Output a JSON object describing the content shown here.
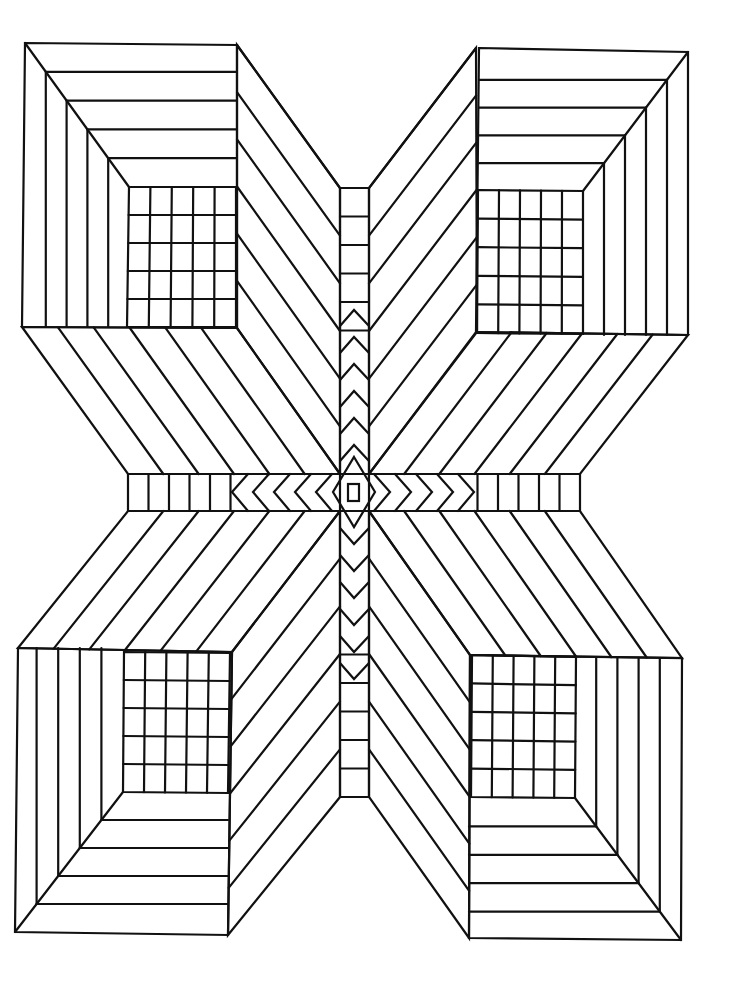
{
  "artwork": {
    "subject": "Geometric optical-illusion line drawing: four open boxes joined by a central cross",
    "stroke_color": "#111111",
    "background_color": "#ffffff",
    "canvas": {
      "width": 731,
      "height": 982
    }
  },
  "center": {
    "x": 354,
    "y": 492
  },
  "vertical_bar": {
    "x1": 340,
    "x2": 369,
    "top": 188,
    "bottom": 797
  },
  "horizontal_bar": {
    "y1": 474,
    "y2": 511,
    "left": 128,
    "right": 580
  },
  "boxes": [
    {
      "name": "top-left",
      "outer": [
        [
          25,
          43
        ],
        [
          237,
          45
        ],
        [
          237,
          328
        ],
        [
          22,
          327
        ]
      ],
      "grid": [
        [
          129,
          187
        ],
        [
          236,
          187
        ],
        [
          236,
          327
        ],
        [
          127,
          327
        ]
      ],
      "grid_cols": 5,
      "grid_rows": 5
    },
    {
      "name": "top-right",
      "outer": [
        [
          479,
          48
        ],
        [
          688,
          52
        ],
        [
          688,
          335
        ],
        [
          476,
          332
        ]
      ],
      "grid": [
        [
          478,
          190
        ],
        [
          583,
          191
        ],
        [
          583,
          334
        ],
        [
          477,
          333
        ]
      ],
      "grid_cols": 5,
      "grid_rows": 5
    },
    {
      "name": "bottom-left",
      "outer": [
        [
          18,
          648
        ],
        [
          232,
          652
        ],
        [
          228,
          935
        ],
        [
          15,
          932
        ]
      ],
      "grid": [
        [
          124,
          652
        ],
        [
          230,
          653
        ],
        [
          228,
          793
        ],
        [
          123,
          792
        ]
      ],
      "grid_cols": 5,
      "grid_rows": 5
    },
    {
      "name": "bottom-right",
      "outer": [
        [
          470,
          655
        ],
        [
          682,
          658
        ],
        [
          681,
          940
        ],
        [
          469,
          938
        ]
      ],
      "grid": [
        [
          472,
          655
        ],
        [
          576,
          657
        ],
        [
          575,
          798
        ],
        [
          471,
          797
        ]
      ],
      "grid_cols": 5,
      "grid_rows": 5
    }
  ]
}
